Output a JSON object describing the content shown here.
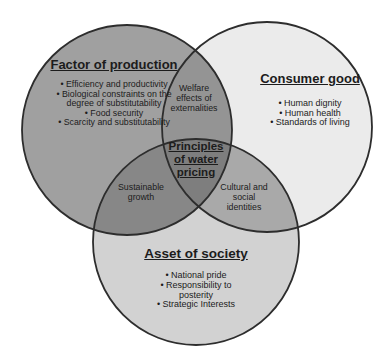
{
  "diagram": {
    "circles": {
      "production": {
        "title": "Factor of production",
        "lines": [
          {
            "text": "Efficiency and productivity",
            "bullet": true
          },
          {
            "text": "Biological constraints on the",
            "bullet": true
          },
          {
            "text": "degree of substitutability",
            "bullet": false
          },
          {
            "text": "Food security",
            "bullet": true
          },
          {
            "text": "Scarcity and substitutability",
            "bullet": true
          }
        ]
      },
      "consumer": {
        "title": "Consumer good",
        "lines": [
          {
            "text": "Human dignity",
            "bullet": true
          },
          {
            "text": "Human health",
            "bullet": true
          },
          {
            "text": "Standards of living",
            "bullet": true
          }
        ]
      },
      "society": {
        "title": "Asset of society",
        "lines": [
          {
            "text": "National pride",
            "bullet": true
          },
          {
            "text": "Responsibility to",
            "bullet": true
          },
          {
            "text": "posterity",
            "bullet": false
          },
          {
            "text": "Strategic Interests",
            "bullet": true
          }
        ]
      }
    },
    "overlaps": {
      "production_consumer": {
        "lines": [
          {
            "text": "Welfare",
            "bullet": false
          },
          {
            "text": "effects of",
            "bullet": false
          },
          {
            "text": "externalities",
            "bullet": false
          }
        ]
      },
      "production_society": {
        "lines": [
          {
            "text": "Sustainable",
            "bullet": false
          },
          {
            "text": "growth",
            "bullet": false
          }
        ]
      },
      "consumer_society": {
        "lines": [
          {
            "text": "Cultural and",
            "bullet": false
          },
          {
            "text": "social",
            "bullet": false
          },
          {
            "text": "identities",
            "bullet": false
          }
        ]
      },
      "center": {
        "lines": [
          {
            "text": "Principles",
            "bullet": false
          },
          {
            "text": "of water",
            "bullet": false
          },
          {
            "text": "pricing",
            "bullet": false
          }
        ]
      }
    },
    "colors": {
      "production_fill": "#a0a0a0",
      "consumer_fill": "#ebebeb",
      "society_fill": "#d2d2d2",
      "production_consumer_fill": "#949494",
      "production_society_fill": "#878787",
      "consumer_society_fill": "#a9a9a9",
      "center_fill": "#7e7e7e",
      "outline": "#2d2d2d",
      "text": "#1c1c1c"
    }
  }
}
